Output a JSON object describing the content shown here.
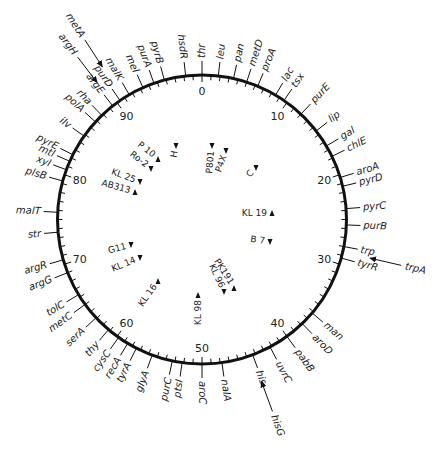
{
  "diagram": {
    "type": "circular-genetic-map",
    "center": [
      202,
      219.5
    ],
    "radius": 144.5,
    "line_color": "#111111",
    "scale": {
      "total_minutes": 100,
      "labeled_minutes": [
        0,
        10,
        20,
        30,
        40,
        50,
        60,
        70,
        80,
        90
      ]
    },
    "genes": [
      {
        "name": "thr",
        "min": 0
      },
      {
        "name": "leu",
        "min": 1.8
      },
      {
        "name": "pan",
        "min": 3.5
      },
      {
        "name": "metD",
        "min": 5
      },
      {
        "name": "proA",
        "min": 6.3
      },
      {
        "name": "lac",
        "min": 8.5
      },
      {
        "name": "tsx",
        "min": 9.6
      },
      {
        "name": "purE",
        "min": 12
      },
      {
        "name": "lip",
        "min": 14.5
      },
      {
        "name": "gal",
        "min": 16.5
      },
      {
        "name": "chlE",
        "min": 17.8
      },
      {
        "name": "aroA",
        "min": 20.3
      },
      {
        "name": "pyrD",
        "min": 21.3
      },
      {
        "name": "pyrC",
        "min": 23.8
      },
      {
        "name": "purB",
        "min": 25.6
      },
      {
        "name": "trp",
        "min": 28
      },
      {
        "name": "tyrR",
        "min": 29.3
      },
      {
        "name": "man",
        "min": 36.2
      },
      {
        "name": "aroD",
        "min": 37.8
      },
      {
        "name": "pabB",
        "min": 40
      },
      {
        "name": "uvrC",
        "min": 42.2
      },
      {
        "name": "his",
        "min": 44.3
      },
      {
        "name": "nalA",
        "min": 47.8
      },
      {
        "name": "aroC",
        "min": 50
      },
      {
        "name": "ptsI",
        "min": 52.2
      },
      {
        "name": "purC",
        "min": 53.3
      },
      {
        "name": "glyA",
        "min": 55.6
      },
      {
        "name": "tyrA",
        "min": 57.5
      },
      {
        "name": "recA",
        "min": 58.6
      },
      {
        "name": "cysC",
        "min": 59.8
      },
      {
        "name": "thy",
        "min": 61.2
      },
      {
        "name": "serA",
        "min": 63.1
      },
      {
        "name": "metC",
        "min": 65
      },
      {
        "name": "tolC",
        "min": 66.3
      },
      {
        "name": "argG",
        "min": 69
      },
      {
        "name": "argR",
        "min": 70.5
      },
      {
        "name": "str",
        "min": 73.6
      },
      {
        "name": "malT",
        "min": 75.8
      },
      {
        "name": "plsB",
        "min": 79.3
      },
      {
        "name": "xyl",
        "min": 80.6
      },
      {
        "name": "mtl",
        "min": 81.6
      },
      {
        "name": "pyrE",
        "min": 82.4
      },
      {
        "name": "ilv",
        "min": 84.8
      },
      {
        "name": "polA",
        "min": 86.8
      },
      {
        "name": "rha",
        "min": 87.8
      },
      {
        "name": "argE",
        "min": 89.4
      },
      {
        "name": "purD",
        "min": 90.4
      },
      {
        "name": "malK",
        "min": 91.6
      },
      {
        "name": "mel",
        "min": 93.3
      },
      {
        "name": "purA",
        "min": 94.6
      },
      {
        "name": "pyrB",
        "min": 95.8
      },
      {
        "name": "hsdR",
        "min": 98.2
      }
    ],
    "external_arrows": [
      {
        "name": "metA",
        "min": 90.8,
        "dir": "in"
      },
      {
        "name": "argH",
        "min": 89.6,
        "dir": "in"
      },
      {
        "name": "trpA",
        "min": 28.6,
        "dir": "in"
      },
      {
        "name": "hisG",
        "min": 44.4,
        "dir": "in"
      }
    ],
    "hfr_strains": [
      {
        "name": "H",
        "x": 176,
        "y": 146,
        "rot": -80,
        "dir": "down"
      },
      {
        "name": "P801",
        "x": 212,
        "y": 146,
        "rot": -85,
        "dir": "down"
      },
      {
        "name": "P4X",
        "x": 226,
        "y": 151,
        "rot": -70,
        "dir": "down"
      },
      {
        "name": "C",
        "x": 256,
        "y": 168,
        "rot": -45,
        "dir": "down"
      },
      {
        "name": "P 10",
        "x": 158,
        "y": 159,
        "rot": 38,
        "dir": "up"
      },
      {
        "name": "Ro-2",
        "x": 151,
        "y": 169,
        "rot": 38,
        "dir": "down"
      },
      {
        "name": "KL 25",
        "x": 140,
        "y": 182,
        "rot": 20,
        "dir": "down"
      },
      {
        "name": "AB313",
        "x": 135,
        "y": 192,
        "rot": 15,
        "dir": "up"
      },
      {
        "name": "KL 19",
        "x": 272,
        "y": 213,
        "rot": 0,
        "dir": "up"
      },
      {
        "name": "B 7",
        "x": 270,
        "y": 242,
        "rot": 8,
        "dir": "down"
      },
      {
        "name": "G11",
        "x": 131,
        "y": 245,
        "rot": -15,
        "dir": "down"
      },
      {
        "name": "KL 14",
        "x": 140,
        "y": 258,
        "rot": -22,
        "dir": "down"
      },
      {
        "name": "KL 16",
        "x": 158,
        "y": 281,
        "rot": -55,
        "dir": "up"
      },
      {
        "name": "KL 98",
        "x": 198,
        "y": 295,
        "rot": -90,
        "dir": "up"
      },
      {
        "name": "KL 96",
        "x": 224,
        "y": 292,
        "rot": 65,
        "dir": "down"
      },
      {
        "name": "PK191",
        "x": 234,
        "y": 288,
        "rot": 58,
        "dir": "up"
      }
    ]
  }
}
